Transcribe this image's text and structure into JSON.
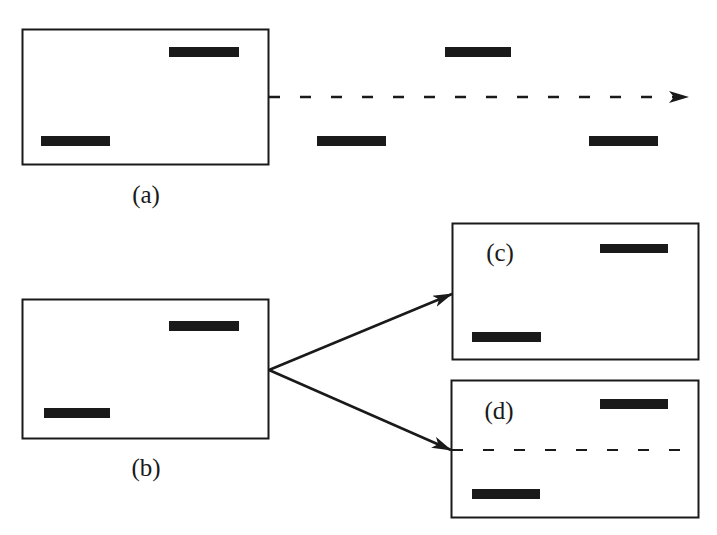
{
  "diagram": {
    "colors": {
      "stroke": "#1a1a1a",
      "bar": "#1a1a1a",
      "background": "#ffffff"
    },
    "panels": [
      {
        "id": "a",
        "label": "(a)"
      },
      {
        "id": "b",
        "label": "(b)"
      },
      {
        "id": "c",
        "label": "(c)"
      },
      {
        "id": "d",
        "label": "(d)"
      }
    ]
  }
}
